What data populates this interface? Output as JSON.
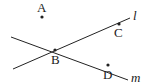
{
  "diagram": {
    "points": {
      "A": {
        "label": "A",
        "x": 42,
        "y": 17
      },
      "B": {
        "label": "B",
        "x": 55,
        "y": 50
      },
      "C": {
        "label": "C",
        "x": 119,
        "y": 24
      },
      "D": {
        "label": "D",
        "x": 108,
        "y": 65
      }
    },
    "lines": {
      "l": {
        "label": "l",
        "through": [
          "B",
          "C"
        ]
      },
      "m": {
        "label": "m",
        "through": [
          "B",
          "D"
        ]
      }
    },
    "colors": {
      "stroke": "#222222",
      "background": "#ffffff"
    }
  }
}
